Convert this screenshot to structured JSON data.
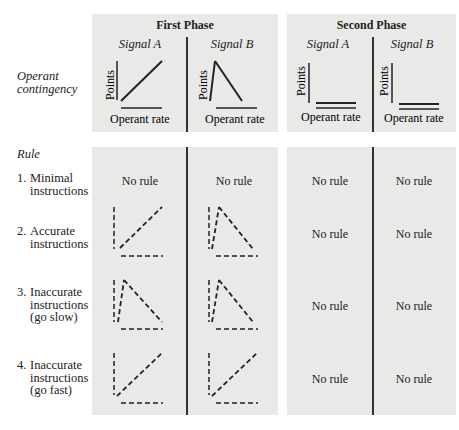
{
  "phases": [
    {
      "title": "First Phase",
      "signals": [
        "Signal A",
        "Signal B"
      ]
    },
    {
      "title": "Second Phase",
      "signals": [
        "Signal A",
        "Signal B"
      ]
    }
  ],
  "rows_header": {
    "operant_label_line1": "Operant",
    "operant_label_line2": "contingency",
    "rule_label": "Rule"
  },
  "axis": {
    "y_label": "Points",
    "x_label": "Operant rate"
  },
  "rules": [
    {
      "num": "1.",
      "lines": [
        "Minimal",
        "instructions"
      ]
    },
    {
      "num": "2.",
      "lines": [
        "Accurate",
        "instructions"
      ]
    },
    {
      "num": "3.",
      "lines": [
        "Inaccurate",
        "instructions",
        "(go slow)"
      ]
    },
    {
      "num": "4.",
      "lines": [
        "Inaccurate",
        "instructions",
        "(go fast)"
      ]
    }
  ],
  "no_rule_text": "No rule",
  "contingencies": {
    "first_phase": {
      "signal_a": "increasing",
      "signal_b": "peak-then-decreasing"
    },
    "second_phase": {
      "signal_a": "flat",
      "signal_b": "flat"
    }
  },
  "rule_cells": [
    [
      "No rule",
      "No rule",
      "No rule",
      "No rule"
    ],
    [
      "increasing (dashed)",
      "peak-then-decreasing (dashed)",
      "No rule",
      "No rule"
    ],
    [
      "peak-then-decreasing (dashed)",
      "peak-then-decreasing (dashed)",
      "No rule",
      "No rule"
    ],
    [
      "increasing (dashed)",
      "increasing (dashed)",
      "No rule",
      "No rule"
    ]
  ]
}
